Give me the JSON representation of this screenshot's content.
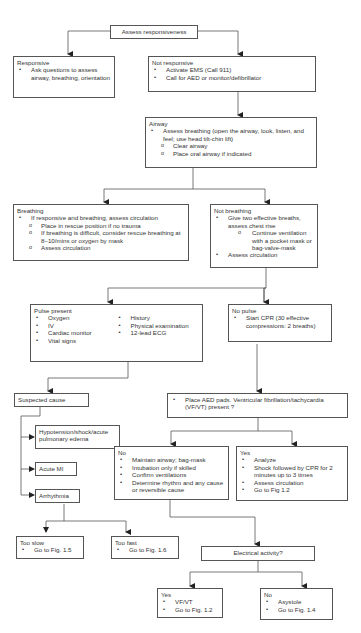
{
  "start": {
    "label": "Assess responsiveness"
  },
  "responsive": {
    "title": "Responsive",
    "items": [
      "Ask questions to assess airway, breathing, orientation"
    ]
  },
  "not_responsive": {
    "title": "Not responsive",
    "items": [
      "Activate EMS (Call 911)",
      "Call for AED or monitor/defibrillator"
    ]
  },
  "airway": {
    "title": "Airway",
    "items": [
      "Assess breathing (open the airway, look, listen, and feel; use head tilt-chin lift)"
    ],
    "subitems": [
      "Clear airway",
      "Place oral airway if indicated"
    ]
  },
  "breathing": {
    "title": "Breathing",
    "items": [
      "If responsive and breathing, assess circulation"
    ],
    "subitems": [
      "Place in rescue position if no trauma",
      "If breathing is difficult, consider rescue breathing at 8–10/mins or oxygen by mask",
      "Assess circulation"
    ]
  },
  "not_breathing": {
    "title": "Not breathing",
    "items": [
      "Give two effective breaths, assess chest rise",
      "Assess circulation"
    ],
    "subitems": [
      "Continue ventilation with a pocket mask or bag-valve-mask"
    ]
  },
  "pulse_present": {
    "title": "Pulse present",
    "col1": [
      "Oxygen",
      "IV",
      "Cardiac monitor",
      "Vital signs"
    ],
    "col2": [
      "History",
      "Physical examination",
      "12-lead ECG"
    ]
  },
  "no_pulse": {
    "title": "No pulse",
    "items": [
      "Start CPR (30  effective compressions: 2 breaths)"
    ]
  },
  "suspected_cause": {
    "label": "Suspected cause"
  },
  "causes": [
    "Hypotension/shock/acute pulmonary edema",
    "Acute MI",
    "Arrhythmia"
  ],
  "aed": {
    "items": [
      "Place AED pads.  Ventricular fibrillation/tachycardia (VF/VT) present ?"
    ]
  },
  "vf_no": {
    "title": "No",
    "items": [
      "Maintain airway; bag-mask",
      "Intubation only if skilled",
      "Confirm ventilations",
      "Determine rhythm and any cause or reversible cause"
    ]
  },
  "vf_yes": {
    "title": "Yes",
    "items": [
      "Analyze",
      "Shock followed by CPR for 2 minutes up to 3 times",
      "Assess circulation",
      "Go to Fig 1.2"
    ]
  },
  "too_slow": {
    "title": "Too slow",
    "items": [
      "Go to Fig. 1.5"
    ]
  },
  "too_fast": {
    "title": "Too fast",
    "items": [
      "Go to Fig. 1.6"
    ]
  },
  "electrical": {
    "label": "Electrical activity?"
  },
  "ea_yes": {
    "title": "Yes",
    "items": [
      "VF/VT",
      "Go to Fig. 1.2"
    ]
  },
  "ea_no": {
    "title": "No",
    "items": [
      "Asystole",
      "Go to Fig. 1.4"
    ]
  },
  "colors": {
    "line": "#555555",
    "text": "#333333",
    "background": "#ffffff"
  }
}
